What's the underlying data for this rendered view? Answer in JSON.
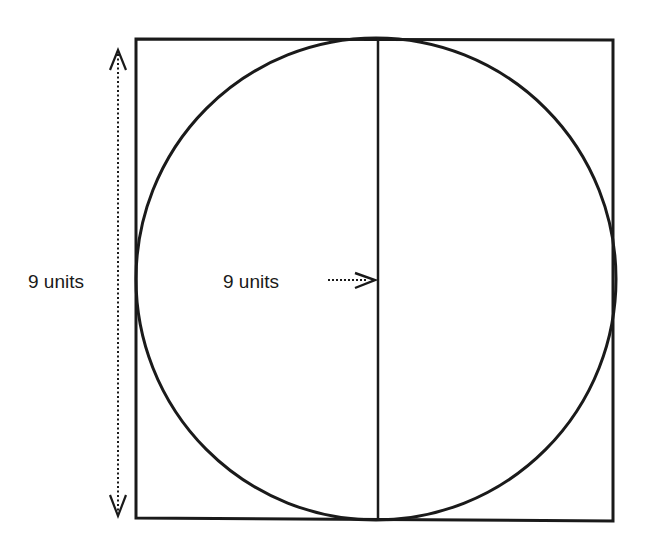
{
  "figure": {
    "type": "geometric-diagram",
    "shapes": {
      "square": {
        "side_label": "9 units"
      },
      "circle": {
        "diameter_label": "9 units"
      },
      "diameter_line": {
        "orientation": "vertical"
      }
    },
    "labels": {
      "height_label": "9 units",
      "diameter_label": "9 units"
    },
    "arrows": {
      "height_arrow": {
        "style": "dotted",
        "direction": "double-headed vertical"
      },
      "diameter_pointer": {
        "style": "dotted",
        "direction": "right"
      }
    },
    "colors": {
      "stroke": "#1a1a1a",
      "background": "#ffffff"
    }
  }
}
